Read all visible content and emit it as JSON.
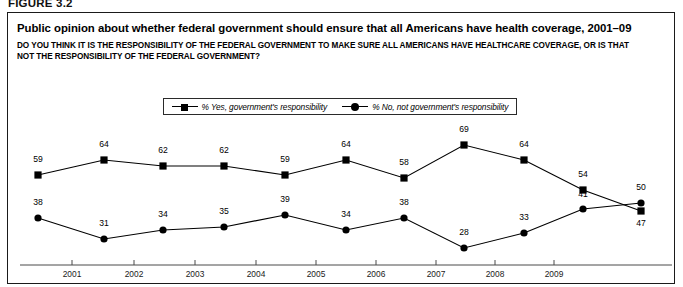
{
  "figure": {
    "label": "FIGURE 3.2"
  },
  "header": {
    "title": "Public opinion about whether federal government should ensure that all Americans have health coverage, 2001–09",
    "subtitle": "DO YOU THINK IT IS THE RESPONSIBILITY OF THE FEDERAL GOVERNMENT TO MAKE SURE ALL AMERICANS HAVE HEALTHCARE COVERAGE, OR IS THAT NOT THE RESPONSIBILITY OF THE FEDERAL GOVERNMENT?"
  },
  "legend": {
    "position": "top-center",
    "items": [
      {
        "label": "% Yes, government's responsibility",
        "marker": "square",
        "color": "#000000"
      },
      {
        "label": "% No, not government's responsibility",
        "marker": "circle",
        "color": "#000000"
      }
    ]
  },
  "axis": {
    "tick_labels": [
      "2001",
      "2002",
      "2003",
      "2004",
      "2005",
      "2006",
      "2007",
      "2008",
      "2009"
    ]
  },
  "chart_data": {
    "type": "line",
    "title": "Public opinion about whether federal government should ensure that all Americans have health coverage, 2001–09",
    "subtitle": "DO YOU THINK IT IS THE RESPONSIBILITY OF THE FEDERAL GOVERNMENT TO MAKE SURE ALL AMERICANS HAVE HEALTHCARE COVERAGE, OR IS THAT NOT THE RESPONSIBILITY OF THE FEDERAL GOVERNMENT?",
    "xlabel": "",
    "ylabel": "",
    "grid": false,
    "legend_position": "top-center",
    "axis_visible": {
      "x": true,
      "y": false
    },
    "ylim": [
      20,
      75
    ],
    "x": [
      "2001",
      "2002",
      "2002",
      "2003",
      "2004",
      "2005",
      "2006",
      "2007",
      "2008",
      "2009",
      "2009"
    ],
    "categories": [
      "2001",
      "2002",
      "2002",
      "2003",
      "2004",
      "2005",
      "2006",
      "2007",
      "2008",
      "2009",
      "2009"
    ],
    "series": [
      {
        "name": "% Yes, government's responsibility",
        "marker": "square",
        "color": "#000000",
        "values": [
          59,
          64,
          62,
          62,
          59,
          64,
          58,
          69,
          64,
          54,
          47
        ]
      },
      {
        "name": "% No, not government's responsibility",
        "marker": "circle",
        "color": "#000000",
        "values": [
          38,
          31,
          34,
          35,
          39,
          34,
          38,
          28,
          33,
          41,
          50
        ]
      }
    ]
  },
  "points": {
    "yes": [
      {
        "value": "59",
        "x": 38,
        "y": 175,
        "lx": 38,
        "ly": 162
      },
      {
        "value": "64",
        "x": 104,
        "y": 160,
        "lx": 104,
        "ly": 147
      },
      {
        "value": "62",
        "x": 163,
        "y": 166,
        "lx": 163,
        "ly": 153
      },
      {
        "value": "62",
        "x": 224,
        "y": 166,
        "lx": 224,
        "ly": 153
      },
      {
        "value": "59",
        "x": 285,
        "y": 175,
        "lx": 285,
        "ly": 162
      },
      {
        "value": "64",
        "x": 346,
        "y": 160,
        "lx": 346,
        "ly": 147
      },
      {
        "value": "58",
        "x": 404,
        "y": 178,
        "lx": 404,
        "ly": 165
      },
      {
        "value": "69",
        "x": 464,
        "y": 145,
        "lx": 464,
        "ly": 132
      },
      {
        "value": "64",
        "x": 524,
        "y": 160,
        "lx": 524,
        "ly": 147
      },
      {
        "value": "54",
        "x": 583,
        "y": 190,
        "lx": 583,
        "ly": 177
      },
      {
        "value": "47",
        "x": 641,
        "y": 211,
        "lx": 641,
        "ly": 226
      }
    ],
    "no": [
      {
        "value": "38",
        "x": 38,
        "y": 218,
        "lx": 38,
        "ly": 205
      },
      {
        "value": "31",
        "x": 104,
        "y": 239,
        "lx": 104,
        "ly": 226
      },
      {
        "value": "34",
        "x": 163,
        "y": 230,
        "lx": 163,
        "ly": 217
      },
      {
        "value": "35",
        "x": 224,
        "y": 227,
        "lx": 224,
        "ly": 214
      },
      {
        "value": "39",
        "x": 285,
        "y": 215,
        "lx": 285,
        "ly": 202
      },
      {
        "value": "34",
        "x": 346,
        "y": 230,
        "lx": 346,
        "ly": 217
      },
      {
        "value": "38",
        "x": 404,
        "y": 218,
        "lx": 404,
        "ly": 205
      },
      {
        "value": "28",
        "x": 464,
        "y": 248,
        "lx": 464,
        "ly": 235
      },
      {
        "value": "33",
        "x": 524,
        "y": 233,
        "lx": 524,
        "ly": 220
      },
      {
        "value": "41",
        "x": 583,
        "y": 209,
        "lx": 583,
        "ly": 197
      },
      {
        "value": "50",
        "x": 641,
        "y": 203,
        "lx": 641,
        "ly": 190
      }
    ]
  },
  "xaxis_ticks": [
    {
      "label": "2001",
      "tick_x": 72,
      "label_x": 72
    },
    {
      "label": "2002",
      "tick_x": 134,
      "label_x": 134
    },
    {
      "label": "2003",
      "tick_x": 195,
      "label_x": 195
    },
    {
      "label": "2004",
      "tick_x": 256,
      "label_x": 256
    },
    {
      "label": "2005",
      "tick_x": 316,
      "label_x": 316
    },
    {
      "label": "2006",
      "tick_x": 376,
      "label_x": 376
    },
    {
      "label": "2007",
      "tick_x": 436,
      "label_x": 436
    },
    {
      "label": "2008",
      "tick_x": 495,
      "label_x": 495
    },
    {
      "label": "2009",
      "tick_x": 554,
      "label_x": 554
    }
  ]
}
